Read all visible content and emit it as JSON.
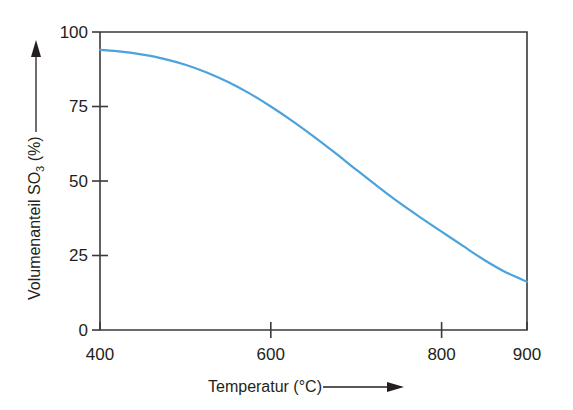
{
  "chart_data": {
    "type": "line",
    "title": "",
    "xlabel": "Temperatur (°C)",
    "ylabel": "Volumenanteil SO3 (%)",
    "ylabel_main": "Volumenanteil SO",
    "ylabel_sub": "3",
    "ylabel_unit": " (%)",
    "xlabel_main": "Temperatur (°C)",
    "xlim": [
      400,
      900
    ],
    "ylim": [
      0,
      100
    ],
    "grid": false,
    "legend": "none",
    "x_ticks": [
      400,
      600,
      800,
      900
    ],
    "x_tick_labels": [
      "400",
      "600",
      "800",
      "900"
    ],
    "y_ticks": [
      0,
      25,
      50,
      75,
      100
    ],
    "y_tick_labels": [
      "0",
      "25",
      "50",
      "75",
      "100"
    ],
    "series": [
      {
        "name": "Volumenanteil SO3",
        "color": "#4ba3dc",
        "x": [
          400,
          425,
          450,
          475,
          500,
          525,
          550,
          575,
          600,
          625,
          650,
          675,
          700,
          725,
          750,
          775,
          800,
          825,
          850,
          875,
          900
        ],
        "values": [
          94,
          93.4,
          92.4,
          91,
          89,
          86.4,
          83.2,
          79.4,
          75,
          70.2,
          65,
          59.5,
          53.8,
          48.2,
          42.8,
          37.8,
          33,
          28.2,
          23.5,
          19.4,
          16.2
        ]
      }
    ],
    "annotations": {
      "y_axis_arrow": "up-arrow",
      "x_axis_arrow": "right-arrow"
    }
  },
  "colors": {
    "curve": "#4ba3dc",
    "axis": "#3a3a3a",
    "text": "#231f20",
    "background": "#ffffff"
  }
}
